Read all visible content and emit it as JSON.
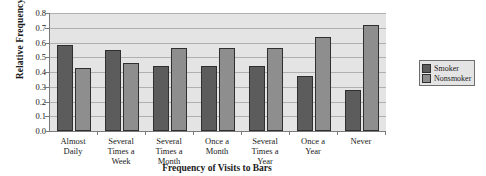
{
  "chart_data": {
    "type": "bar",
    "title": "",
    "xlabel": "Frequency of Visits to Bars",
    "ylabel": "Relative Frequency",
    "categories": [
      "Almost\nDaily",
      "Several\nTimes a\nWeek",
      "Several\nTimes a\nMonth",
      "Once a\nMonth",
      "Several\nTimes a\nYear",
      "Once a\nYear",
      "Never"
    ],
    "series": [
      {
        "name": "Smoker",
        "color": "#5c5c5c",
        "values": [
          0.58,
          0.55,
          0.44,
          0.44,
          0.44,
          0.37,
          0.28
        ]
      },
      {
        "name": "Nonsmoker",
        "color": "#8e8e8e",
        "values": [
          0.43,
          0.46,
          0.56,
          0.56,
          0.56,
          0.64,
          0.72
        ]
      }
    ],
    "ylim": [
      0.0,
      0.8
    ],
    "ytick_labels": [
      "0.0",
      "0.1",
      "0.2",
      "0.3",
      "0.4",
      "0.5",
      "0.6",
      "0.7",
      "0.8"
    ],
    "ytick_values": [
      0.0,
      0.1,
      0.2,
      0.3,
      0.4,
      0.5,
      0.6,
      0.7,
      0.8
    ],
    "grid": true,
    "legend_position": "right",
    "plot_background": "#e4e4e4",
    "gridline_color": "#b0b0b0",
    "axis_color": "#7b7b7b"
  },
  "legend": {
    "entries": [
      {
        "label": "Smoker"
      },
      {
        "label": "Nonsmoker"
      }
    ]
  }
}
